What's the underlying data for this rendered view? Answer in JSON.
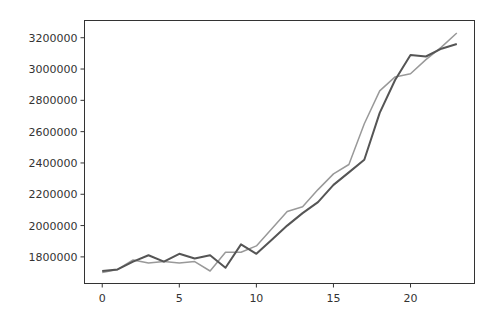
{
  "chart_data": {
    "type": "line",
    "title": "",
    "xlabel": "",
    "ylabel": "",
    "x": [
      0,
      1,
      2,
      3,
      4,
      5,
      6,
      7,
      8,
      9,
      10,
      11,
      12,
      13,
      14,
      15,
      16,
      17,
      18,
      19,
      20,
      21,
      22,
      23
    ],
    "xlim": [
      -1.15,
      24.15
    ],
    "ylim": [
      1630000,
      3310000
    ],
    "x_ticks": [
      0,
      5,
      10,
      15,
      20
    ],
    "y_ticks": [
      1800000,
      2000000,
      2200000,
      2400000,
      2600000,
      2800000,
      3000000,
      3200000
    ],
    "x_tick_labels": [
      "0",
      "5",
      "10",
      "15",
      "20"
    ],
    "y_tick_labels": [
      "1800000",
      "2000000",
      "2200000",
      "2400000",
      "2600000",
      "2800000",
      "3000000",
      "3200000"
    ],
    "grid": false,
    "legend": null,
    "series": [
      {
        "name": "series_dark",
        "color": "#555555",
        "values": [
          1710000,
          1720000,
          1770000,
          1810000,
          1770000,
          1820000,
          1790000,
          1810000,
          1730000,
          1880000,
          1820000,
          1910000,
          2000000,
          2080000,
          2150000,
          2260000,
          2340000,
          2420000,
          2720000,
          2930000,
          3090000,
          3080000,
          3130000,
          3160000
        ]
      },
      {
        "name": "series_light",
        "color": "#999999",
        "values": [
          1700000,
          1720000,
          1780000,
          1760000,
          1770000,
          1760000,
          1770000,
          1710000,
          1830000,
          1830000,
          1870000,
          1980000,
          2090000,
          2120000,
          2230000,
          2330000,
          2390000,
          2650000,
          2860000,
          2950000,
          2970000,
          3060000,
          3140000,
          3230000
        ]
      }
    ]
  }
}
